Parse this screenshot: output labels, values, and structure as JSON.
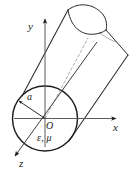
{
  "figure": {
    "kind": "geometry-diagram",
    "stroke_color": "#2b2b2b",
    "axis_color": "#555555",
    "dashed_color": "#9a9a9a",
    "background_color": "#ffffff",
    "width": 136,
    "height": 177
  },
  "axes": {
    "x": {
      "label": "x",
      "arrow": true
    },
    "y": {
      "label": "y",
      "arrow": true
    },
    "z": {
      "label": "z",
      "arrow": true
    },
    "origin": {
      "label": "O"
    }
  },
  "annotations": {
    "radius": {
      "label": "a",
      "arrow": true
    },
    "material": {
      "label": "ε, μ"
    }
  }
}
